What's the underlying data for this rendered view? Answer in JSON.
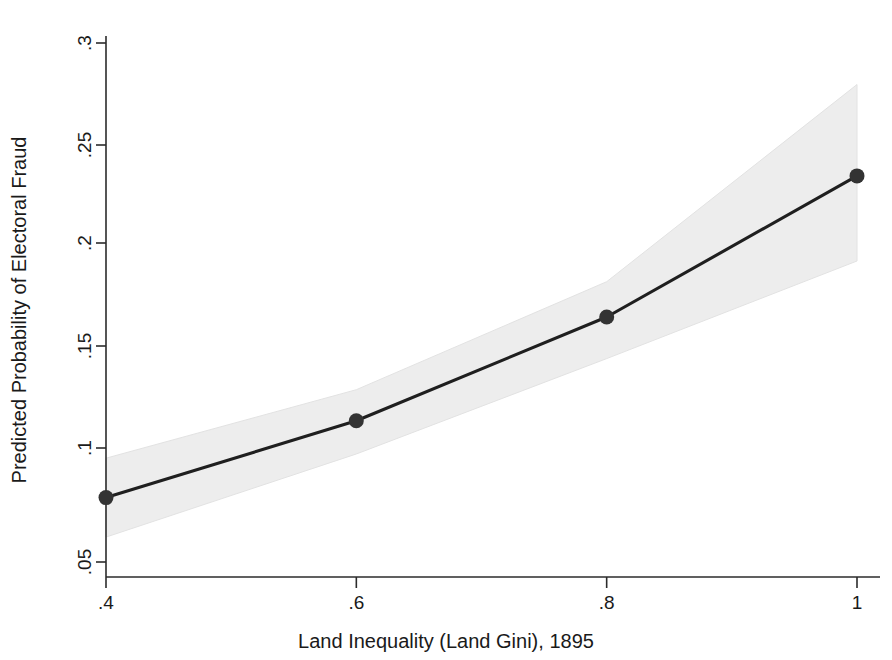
{
  "chart_data": {
    "type": "line",
    "title": "",
    "subtitle": "",
    "xlabel": "Land Inequality (Land Gini), 1895",
    "ylabel": "Predicted Probability of Electoral Fraud",
    "x": [
      0.4,
      0.6,
      0.8,
      1.0
    ],
    "values": [
      0.081,
      0.118,
      0.168,
      0.236
    ],
    "series": [
      {
        "name": "Predicted probability",
        "values": [
          0.081,
          0.118,
          0.168,
          0.236
        ],
        "ci_lower": [
          0.062,
          0.102,
          0.148,
          0.195
        ],
        "ci_upper": [
          0.1,
          0.133,
          0.185,
          0.28
        ]
      }
    ],
    "xlim": [
      0.4,
      1.0
    ],
    "ylim": [
      0.043,
      0.305
    ],
    "xticks": [
      0.4,
      0.6,
      0.8,
      1.0
    ],
    "xtick_labels": [
      ".4",
      ".6",
      ".8",
      "1"
    ],
    "yticks": [
      0.05,
      0.1,
      0.15,
      0.2,
      0.25,
      0.3
    ],
    "ytick_labels": [
      ".05",
      ".1",
      ".15",
      ".2",
      ".25",
      ".3"
    ],
    "grid": false,
    "legend": "none",
    "marker": "filled-circle",
    "band_label": "95% confidence interval",
    "colors": {
      "line": "#1f1f1f",
      "marker": "#333333",
      "band": "#ededed",
      "axis": "#2b2b2b",
      "background": "#ffffff"
    }
  },
  "axes": {
    "x_tick_labels": [
      ".4",
      ".6",
      ".8",
      "1"
    ],
    "y_tick_labels": [
      ".05",
      ".1",
      ".15",
      ".2",
      ".25",
      ".3"
    ],
    "x_title": "Land Inequality (Land Gini), 1895",
    "y_title": "Predicted Probability of Electoral Fraud"
  }
}
